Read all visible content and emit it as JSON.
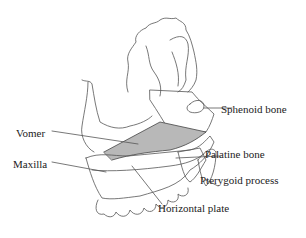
{
  "figure": {
    "colors": {
      "line": "#555555",
      "vomer_fill": "#b8b8b8",
      "background": "#ffffff"
    }
  },
  "labels": {
    "vomer": "Vomer",
    "maxilla": "Maxilla",
    "sphenoid": "Sphenoid bone",
    "palatine": "Palatine bone",
    "pterygoid": "Pterygoid process",
    "horizontal_plate": "Horizontal plate"
  }
}
